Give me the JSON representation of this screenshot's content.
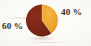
{
  "figure": {
    "background_color": "#fcfbf8",
    "text_color": "#3b3027"
  },
  "chart_data": {
    "type": "pie",
    "title": "",
    "subtitle": "",
    "xlabel": "",
    "ylabel": "",
    "legend_position": "none",
    "grid": false,
    "categories": [
      "40 %",
      "60 %"
    ],
    "values": [
      40,
      60
    ],
    "unit": "%",
    "start_angle_deg": 0,
    "direction": "clockwise",
    "slices": [
      {
        "label": "40 %",
        "value": 40,
        "color": "#eda62e",
        "label_position": "right",
        "start_angle_deg": 0,
        "end_angle_deg": 144
      },
      {
        "label": "60 %",
        "value": 60,
        "color": "#7a2517",
        "label_position": "left",
        "start_angle_deg": 144,
        "end_angle_deg": 360
      }
    ],
    "annotations": [
      {
        "name": "right-percent-label",
        "text": "40 %"
      },
      {
        "name": "left-percent-label",
        "text": "60 %"
      }
    ]
  }
}
